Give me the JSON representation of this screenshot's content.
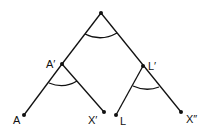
{
  "diagram": {
    "type": "tree",
    "nodes": [
      {
        "id": "root",
        "label": "",
        "x": 101,
        "y": 13
      },
      {
        "id": "A_prime",
        "label": "A′",
        "x": 62,
        "y": 64
      },
      {
        "id": "L_prime",
        "label": "L′",
        "x": 143,
        "y": 66
      },
      {
        "id": "A",
        "label": "A",
        "x": 24,
        "y": 115
      },
      {
        "id": "X_prime",
        "label": "X′",
        "x": 104,
        "y": 112
      },
      {
        "id": "L",
        "label": "L",
        "x": 116,
        "y": 115
      },
      {
        "id": "X_double_prime",
        "label": "X″",
        "x": 181,
        "y": 112
      }
    ],
    "edges": [
      [
        "root",
        "A_prime"
      ],
      [
        "root",
        "L_prime"
      ],
      [
        "A_prime",
        "A"
      ],
      [
        "A_prime",
        "X_prime"
      ],
      [
        "L_prime",
        "L"
      ],
      [
        "L_prime",
        "X_double_prime"
      ]
    ],
    "angle_arcs": [
      "root",
      "A_prime",
      "L_prime"
    ]
  }
}
